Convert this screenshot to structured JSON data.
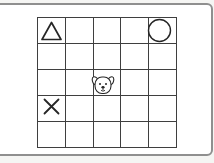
{
  "app": {
    "description": "5x5 grid board with shape tokens and a dog character"
  },
  "board": {
    "rows": 5,
    "cols": 5,
    "tokens": [
      {
        "icon": "triangle-icon",
        "label": "triangle",
        "row": 0,
        "col": 0
      },
      {
        "icon": "circle-icon",
        "label": "circle",
        "row": 0,
        "col": 4
      },
      {
        "icon": "dog-face-icon",
        "label": "dog face",
        "row": 2,
        "col": 2
      },
      {
        "icon": "x-mark-icon",
        "label": "x mark",
        "row": 3,
        "col": 0
      }
    ]
  },
  "colors": {
    "page_background": "#f5f5f3",
    "card_background": "#ffffff",
    "card_border": "#8f8f8f",
    "grid_line": "#3f3f3f",
    "shape_stroke": "#262626"
  }
}
